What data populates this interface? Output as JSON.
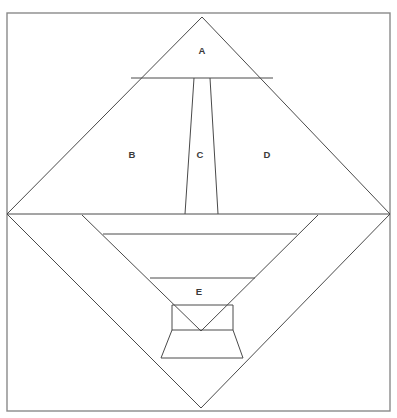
{
  "figure": {
    "canvas": {
      "width": 397,
      "height": 418,
      "background": "#ffffff"
    },
    "stroke_color": "#4a4a4a",
    "border_color": "#8a8a8a",
    "label_color": "#3a3a3a",
    "border": {
      "x": 7,
      "y": 13,
      "width": 383,
      "height": 398
    },
    "key_points": {
      "apex_top": {
        "x": 202,
        "y": 17
      },
      "vertex_left": {
        "x": 7,
        "y": 214
      },
      "vertex_right": {
        "x": 390,
        "y": 214
      },
      "apex_bottom": {
        "x": 201,
        "y": 408
      }
    },
    "labels": [
      {
        "id": "A",
        "text": "A",
        "x": 202,
        "y": 51
      },
      {
        "id": "B",
        "text": "B",
        "x": 132,
        "y": 155
      },
      {
        "id": "C",
        "text": "C",
        "x": 200,
        "y": 155
      },
      {
        "id": "D",
        "text": "D",
        "x": 267,
        "y": 155
      },
      {
        "id": "E",
        "text": "E",
        "x": 199,
        "y": 292
      }
    ],
    "shapes": {
      "upper_triangle": "202,17 390,214 7,214",
      "lower_triangle": "7,214 390,214 201,408",
      "a_trapezoid_base": "131,78 273,78",
      "c_trapezoid": "194,78 210,78 218,214 185,214",
      "inner_diamond_upper": "82,215 201,331 318,215",
      "inner_band_top": "103,234 297,234",
      "e_trapezoid_top": "150,278 255,278",
      "e_rectangle": "172,305 233,305 233,330 172,330",
      "e_lower_trapezoid": "172,330 233,330 243,358 161,358"
    },
    "polylines": [
      {
        "name": "outer-diamond",
        "points": "202,17 390,214 201,408 7,214 202,17"
      },
      {
        "name": "horizontal-midline",
        "points": "7,214 390,214"
      },
      {
        "name": "a-base-line",
        "points": "131,78 273,78"
      },
      {
        "name": "c-left-edge",
        "points": "194,78 185,214"
      },
      {
        "name": "c-right-edge",
        "points": "210,78 218,214"
      },
      {
        "name": "inner-diamond-left-edge",
        "points": "82,215 201,331"
      },
      {
        "name": "inner-diamond-right-edge",
        "points": "318,215 201,331"
      },
      {
        "name": "inner-band-line",
        "points": "103,234 297,234"
      },
      {
        "name": "e-top-line",
        "points": "150,278 255,278"
      },
      {
        "name": "e-rect-top",
        "points": "172,305 233,305"
      },
      {
        "name": "e-rect-left",
        "points": "172,305 172,330"
      },
      {
        "name": "e-rect-right",
        "points": "233,305 233,330"
      },
      {
        "name": "e-rect-bottom",
        "points": "172,330 233,330"
      },
      {
        "name": "e-lower-left",
        "points": "172,330 161,358"
      },
      {
        "name": "e-lower-right",
        "points": "233,330 243,358"
      },
      {
        "name": "e-lower-bottom",
        "points": "161,358 243,358"
      }
    ]
  }
}
